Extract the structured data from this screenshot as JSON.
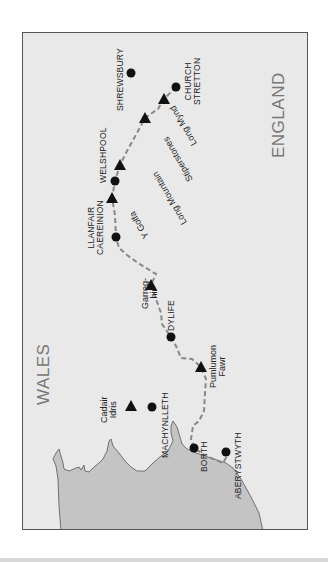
{
  "map": {
    "title": "Glyndŵr's Way route map",
    "colors": {
      "land": "#e9e9e9",
      "sea": "#c4c4c4",
      "border": "#555555",
      "route": "#888888",
      "marker": "#111111",
      "country_label": "#777777"
    },
    "countries": [
      {
        "name": "WALES"
      },
      {
        "name": "ENGLAND"
      }
    ],
    "towns": [
      {
        "name": "SHREWSBURY",
        "lines": [
          "SHREWSBURY"
        ]
      },
      {
        "name": "CHURCH STRETTON",
        "lines": [
          "CHURCH",
          "STRETTON"
        ]
      },
      {
        "name": "WELSHPOOL",
        "lines": [
          "WELSHPOOL"
        ]
      },
      {
        "name": "LLANFAIR CAEREINION",
        "lines": [
          "LLANFAIR",
          "CAEREINION"
        ]
      },
      {
        "name": "DYLIFE",
        "lines": [
          "DYLIFE"
        ]
      },
      {
        "name": "MACHYNLLETH",
        "lines": [
          "MACHYNLLETH"
        ]
      },
      {
        "name": "BORTH",
        "lines": [
          "BORTH"
        ]
      },
      {
        "name": "ABERYSTWYTH",
        "lines": [
          "ABERYSTWYTH"
        ]
      }
    ],
    "hills": [
      {
        "name": "Long Mynd",
        "lines": [
          "Long Mynd"
        ]
      },
      {
        "name": "Stiperstones",
        "lines": [
          "Stiperstones"
        ]
      },
      {
        "name": "Long Mountain",
        "lines": [
          "Long Mountain"
        ]
      },
      {
        "name": "Y Golfa",
        "lines": [
          "Y Golfa"
        ]
      },
      {
        "name": "Garreg-hir",
        "lines": [
          "Garreg-",
          "hir"
        ]
      },
      {
        "name": "Pumlumon Fawr",
        "lines": [
          "Pumlumon",
          "Fawr"
        ]
      },
      {
        "name": "Cadair Idris",
        "lines": [
          "Cadair",
          "Idris"
        ]
      }
    ]
  }
}
